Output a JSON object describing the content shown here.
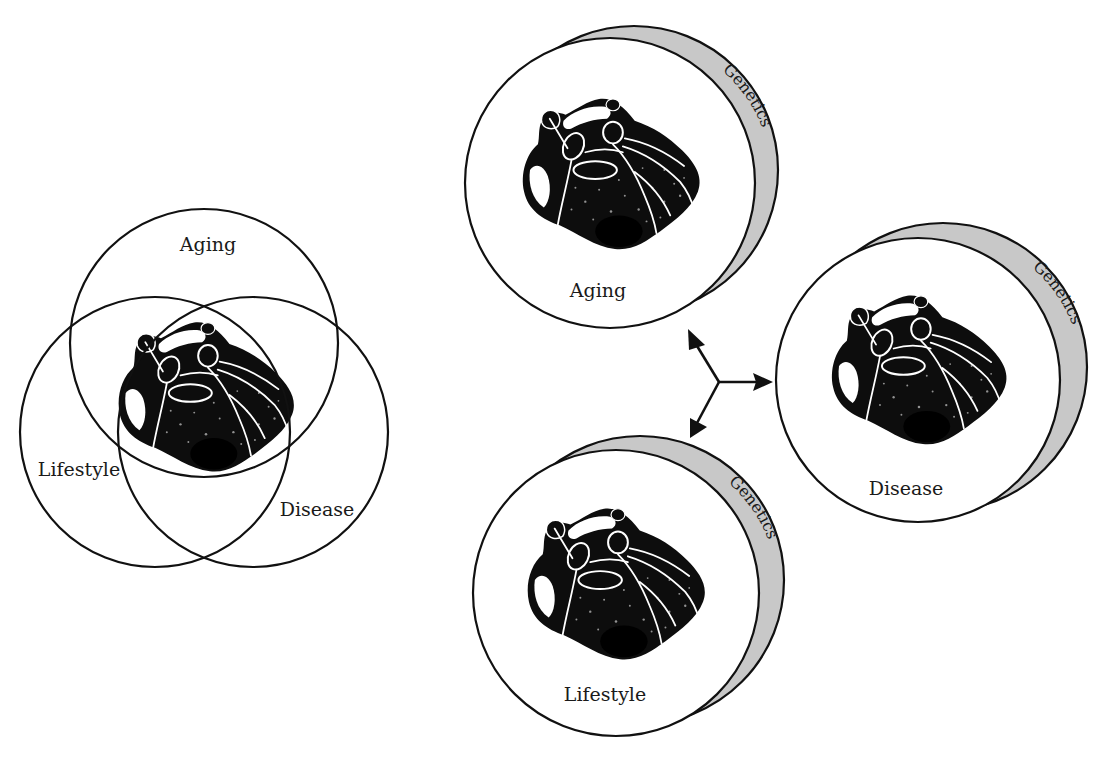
{
  "figure": {
    "colors": {
      "line": "#111111",
      "genetics_band": "#c8c8c8",
      "text": "#1a1a1a",
      "background": "#ffffff"
    }
  },
  "venn": {
    "labels": {
      "aging": "Aging",
      "lifestyle": "Lifestyle",
      "disease": "Disease"
    },
    "center_image": "heart-illustration"
  },
  "circles": [
    {
      "id": "aging",
      "label": "Aging",
      "band_label": "Genetics"
    },
    {
      "id": "disease",
      "label": "Disease",
      "band_label": "Genetics"
    },
    {
      "id": "lifestyle",
      "label": "Lifestyle",
      "band_label": "Genetics"
    }
  ],
  "arrows": {
    "origin": "center",
    "targets": [
      "Aging",
      "Disease",
      "Lifestyle"
    ]
  }
}
